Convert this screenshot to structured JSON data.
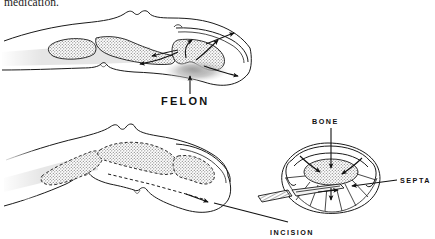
{
  "figure": {
    "caption_top": "medication.",
    "panels": [
      {
        "id": "panel-felon",
        "name": "felon-lateral-section",
        "description": "Lateral sagittal section of fingertip showing felon abscess in pulp space",
        "labels": [
          {
            "key": "felon",
            "text": "FELON"
          }
        ]
      },
      {
        "id": "panel-incision",
        "name": "incision-and-cross-section",
        "description": "Lateral view of finger with incision line, plus transverse cross-section of distal pulp",
        "labels": [
          {
            "key": "bone",
            "text": "BONE"
          },
          {
            "key": "septa",
            "text": "SEPTA"
          },
          {
            "key": "incision",
            "text": "INCISION"
          }
        ]
      }
    ],
    "colors": {
      "ink": "#1a1a1a",
      "background": "#ffffff",
      "stipple": "#8a8a8a",
      "abscess_shadow": "#b8b8b8"
    }
  }
}
